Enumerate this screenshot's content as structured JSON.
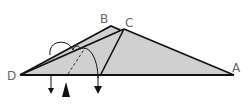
{
  "diagram": {
    "type": "origami-fold-step",
    "labels": {
      "A": "A",
      "B": "B",
      "C": "C",
      "D": "D"
    },
    "colors": {
      "fill": "#d0d0d0",
      "stroke": "#111111",
      "label": "#666666"
    },
    "annotations": {
      "fold_arrows": 2,
      "valley_fold_line": "dashed",
      "mountain_marker": "filled-triangle"
    }
  }
}
